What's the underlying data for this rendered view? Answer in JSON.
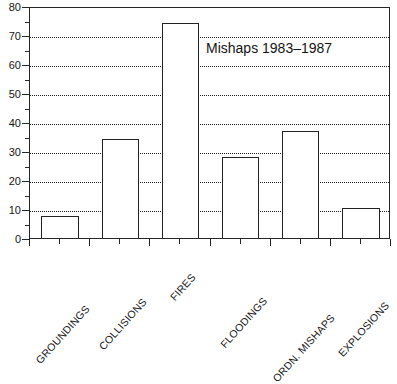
{
  "chart_data": {
    "type": "bar",
    "title": "Mishaps 1983–1987",
    "xlabel": "",
    "ylabel": "",
    "ylim": [
      0,
      80
    ],
    "ytick_step": 10,
    "yminor_step": 5,
    "grid": "horizontal-dotted",
    "legend": "none",
    "categories": [
      "GROUNDINGS",
      "COLLISIONS",
      "FIRES",
      "FLOODINGS",
      "ORDN. MISHAPS",
      "EXPLOSIONS"
    ],
    "values": [
      7.5,
      34,
      74,
      28,
      37,
      10.5
    ],
    "ytick_labels": [
      "0",
      "10",
      "20",
      "30",
      "40",
      "50",
      "60",
      "70",
      "80"
    ],
    "bar_style": {
      "fill": "#ffffff",
      "edge": "#222222"
    }
  },
  "axes": {
    "y_ticks": [
      {
        "label": "80",
        "value": 80
      },
      {
        "label": "70",
        "value": 70
      },
      {
        "label": "60",
        "value": 60
      },
      {
        "label": "50",
        "value": 50
      },
      {
        "label": "40",
        "value": 40
      },
      {
        "label": "30",
        "value": 30
      },
      {
        "label": "20",
        "value": 20
      },
      {
        "label": "10",
        "value": 10
      },
      {
        "label": "0",
        "value": 0
      }
    ]
  }
}
